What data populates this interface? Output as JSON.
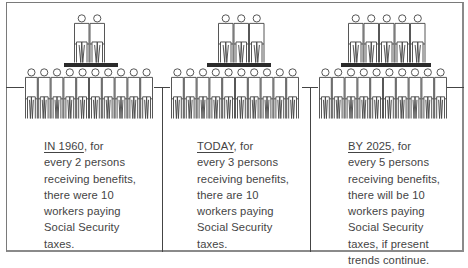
{
  "panels": [
    {
      "beneficiaries": 2,
      "workers": 10,
      "caption": {
        "lead": "IN 1960",
        "lead_rest": ", for",
        "lines": [
          "every 2 persons",
          "receiving benefits,",
          "there were 10",
          "workers paying",
          "Social Security",
          "taxes."
        ]
      }
    },
    {
      "beneficiaries": 3,
      "workers": 10,
      "caption": {
        "lead": "TODAY",
        "lead_rest": ", for",
        "lines": [
          "every 3 persons",
          "receiving benefits,",
          "there are 10",
          "workers paying",
          "Social Security",
          "taxes."
        ]
      }
    },
    {
      "beneficiaries": 5,
      "workers": 10,
      "caption": {
        "lead": "BY 2025",
        "lead_rest": ", for",
        "lines": [
          "every 5 persons",
          "receiving benefits,",
          "there will be 10",
          "workers paying",
          "Social Security",
          "taxes, if present",
          "trends continue."
        ]
      }
    }
  ],
  "colors": {
    "line": "#444444",
    "platform": "#2b2b2b",
    "text": "#444444"
  }
}
